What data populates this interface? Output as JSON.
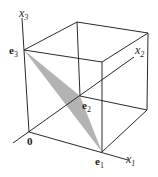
{
  "diagram": {
    "type": "unit-cube-with-simplex",
    "axes": [
      {
        "id": "x1",
        "label": "x",
        "subscript": "1"
      },
      {
        "id": "x2",
        "label": "x",
        "subscript": "2"
      },
      {
        "id": "x3",
        "label": "x",
        "subscript": "3"
      }
    ],
    "points": [
      {
        "id": "origin",
        "label": "0"
      },
      {
        "id": "e1",
        "label": "e",
        "subscript": "1"
      },
      {
        "id": "e2",
        "label": "e",
        "subscript": "2"
      },
      {
        "id": "e3",
        "label": "e",
        "subscript": "3"
      }
    ],
    "shaded_region": {
      "vertices": [
        "e1",
        "e2",
        "e3"
      ],
      "color": "#b3b3b3"
    },
    "colors": {
      "line": "#2a2a2a",
      "fill": "#b3b3b3"
    }
  }
}
